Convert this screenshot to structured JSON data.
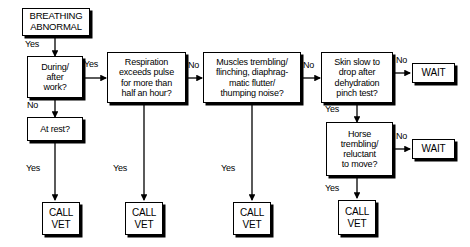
{
  "diagram": {
    "nodes": [
      {
        "id": "start",
        "label": "BREATHING\nABNORMAL",
        "kind": "terminal"
      },
      {
        "id": "d1",
        "label": "During/\nafter\nwork?",
        "kind": "decision"
      },
      {
        "id": "d2",
        "label": "At rest?",
        "kind": "decision"
      },
      {
        "id": "d3",
        "label": "Respiration\nexceeds pulse\nfor more than\nhalf an hour?",
        "kind": "decision"
      },
      {
        "id": "d4",
        "label": "Muscles trembling/\nflinching, diaphrag-\nmatic  flutter/\nthumping noise?",
        "kind": "decision"
      },
      {
        "id": "d5",
        "label": "Skin slow to\ndrop after\ndehydration\npinch  test?",
        "kind": "decision"
      },
      {
        "id": "d6",
        "label": "Horse\ntrembling/\nreluctant\nto move?",
        "kind": "decision"
      },
      {
        "id": "wait1",
        "label": "WAIT",
        "kind": "action"
      },
      {
        "id": "wait2",
        "label": "WAIT",
        "kind": "action"
      },
      {
        "id": "vet1",
        "label": "CALL\nVET",
        "kind": "action"
      },
      {
        "id": "vet2",
        "label": "CALL\nVET",
        "kind": "action"
      },
      {
        "id": "vet3",
        "label": "CALL\nVET",
        "kind": "action"
      },
      {
        "id": "vet4",
        "label": "CALL\nVET",
        "kind": "action"
      }
    ],
    "edge_labels": [
      {
        "id": "e-start-d1",
        "text": "Yes"
      },
      {
        "id": "e-d1-d3",
        "text": "Yes"
      },
      {
        "id": "e-d1-d2",
        "text": "No"
      },
      {
        "id": "e-d2-vet1",
        "text": "Yes"
      },
      {
        "id": "e-d3-d4",
        "text": "No"
      },
      {
        "id": "e-d3-vet2",
        "text": "Yes"
      },
      {
        "id": "e-d4-d5",
        "text": "No"
      },
      {
        "id": "e-d4-vet3",
        "text": "Yes"
      },
      {
        "id": "e-d5-wait1",
        "text": "No"
      },
      {
        "id": "e-d5-d6",
        "text": "Yes"
      },
      {
        "id": "e-d6-wait2",
        "text": "No"
      },
      {
        "id": "e-d6-vet4",
        "text": "Yes"
      }
    ]
  }
}
